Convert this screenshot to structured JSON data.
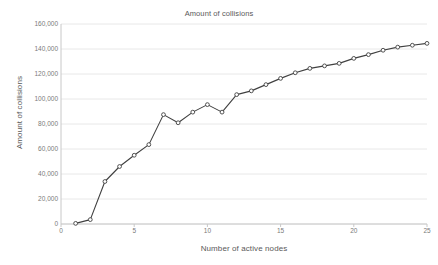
{
  "chart_data": {
    "type": "line",
    "title": "Amount of collisions",
    "xlabel": "Number of active nodes",
    "ylabel": "Amount of collisions",
    "xlim": [
      0,
      25
    ],
    "ylim": [
      0,
      160000
    ],
    "grid": true,
    "grid_axis": "y",
    "legend": false,
    "marker": "open-circle",
    "line_color": "#404040",
    "marker_color": "#404040",
    "grid_color": "#e8e8e8",
    "axis_color": "#c8c8c8",
    "text_color": "#595959",
    "x": [
      1,
      2,
      3,
      4,
      5,
      6,
      7,
      8,
      9,
      10,
      11,
      12,
      13,
      14,
      15,
      16,
      17,
      18,
      19,
      20,
      21,
      22,
      23,
      24,
      25
    ],
    "values": [
      500,
      3500,
      34000,
      46000,
      55000,
      63500,
      87500,
      81000,
      89500,
      95500,
      89500,
      103500,
      106500,
      111500,
      116500,
      121000,
      124500,
      126500,
      128500,
      132500,
      135500,
      139000,
      141500,
      143000,
      144500
    ],
    "x_ticks": [
      0,
      5,
      10,
      15,
      20,
      25
    ],
    "x_tick_labels": [
      "0",
      "5",
      "10",
      "15",
      "20",
      "25"
    ],
    "y_ticks": [
      0,
      20000,
      40000,
      60000,
      80000,
      100000,
      120000,
      140000,
      160000
    ],
    "y_tick_labels": [
      "0",
      "20,000",
      "40,000",
      "60,000",
      "80,000",
      "100,000",
      "120,000",
      "140,000",
      "160,000"
    ]
  }
}
